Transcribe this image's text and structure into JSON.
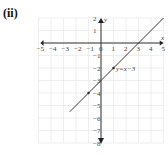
{
  "part_label": "(ii)",
  "chart_data": {
    "type": "line",
    "title": "",
    "xlabel": "x",
    "ylabel": "y",
    "xlim": [
      -5,
      5
    ],
    "ylim": [
      -8,
      2
    ],
    "grid": true,
    "x_ticks": [
      -5,
      -4,
      -3,
      -2,
      -1,
      0,
      1,
      2,
      3,
      4,
      5
    ],
    "y_ticks": [
      2,
      1,
      -1,
      -2,
      -3,
      -4,
      -5,
      -6,
      -7,
      -8
    ],
    "series": [
      {
        "name": "y = x − 3",
        "equation": "y=x−3",
        "x": [
          -2.5,
          5
        ],
        "y": [
          -5.5,
          2
        ],
        "points": [
          [
            1,
            -2
          ],
          [
            -1,
            -4
          ]
        ],
        "color": "#333333"
      }
    ],
    "annotation": "y=x−3"
  }
}
